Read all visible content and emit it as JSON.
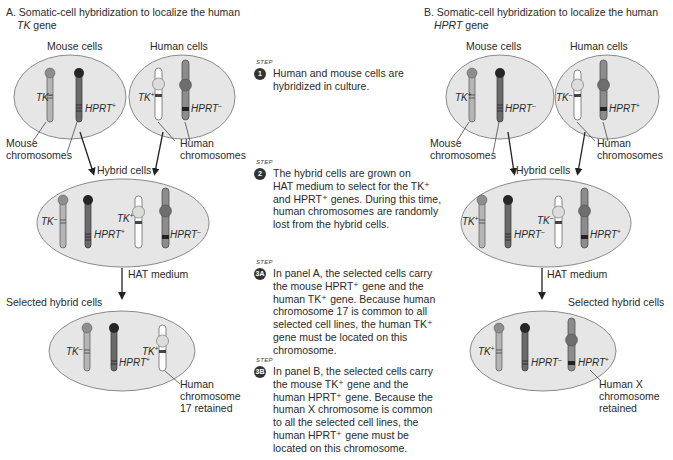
{
  "panelA": {
    "title_line1": "A. Somatic-cell hybridization to localize the human",
    "title_gene": "TK",
    "title_line2_suffix": " gene",
    "mouse_cells_label": "Mouse cells",
    "human_cells_label": "Human cells",
    "mouse_chromosomes_label_1": "Mouse",
    "mouse_chromosomes_label_2": "chromosomes",
    "human_chromosomes_label_1": "Human",
    "human_chromosomes_label_2": "chromosomes",
    "hybrid_cells_label": "Hybrid cells",
    "hat_medium_label": "HAT medium",
    "selected_label": "Selected hybrid cells",
    "retained_label_1": "Human",
    "retained_label_2": "chromosome",
    "retained_label_3": "17 retained",
    "mouse_cell": {
      "tk": "TK",
      "tk_sign": "–",
      "hprt": "HPRT",
      "hprt_sign": "+"
    },
    "human_cell": {
      "tk": "TK",
      "tk_sign": "+",
      "hprt": "HPRT",
      "hprt_sign": "–"
    },
    "hybrid_cell": {
      "mouse_tk": "TK",
      "mouse_tk_sign": "–",
      "mouse_hprt": "HPRT",
      "mouse_hprt_sign": "+",
      "human_tk": "TK",
      "human_tk_sign": "+",
      "human_hprt": "HPRT",
      "human_hprt_sign": "–"
    },
    "selected_cell": {
      "mouse_tk": "TK",
      "mouse_tk_sign": "–",
      "mouse_hprt": "HPRT",
      "mouse_hprt_sign": "+",
      "human_tk": "TK",
      "human_tk_sign": "+"
    }
  },
  "panelB": {
    "title_line1": "B. Somatic-cell hybridization to localize the human",
    "title_gene": "HPRT",
    "title_line2_suffix": " gene",
    "mouse_cells_label": "Mouse cells",
    "human_cells_label": "Human cells",
    "mouse_chromosomes_label_1": "Mouse",
    "mouse_chromosomes_label_2": "chromosomes",
    "human_chromosomes_label_1": "Human",
    "human_chromosomes_label_2": "chromosomes",
    "hybrid_cells_label": "Hybrid cells",
    "hat_medium_label": "HAT medium",
    "selected_label": "Selected hybrid cells",
    "retained_label_1": "Human X",
    "retained_label_2": "chromosome",
    "retained_label_3": "retained",
    "mouse_cell": {
      "tk": "TK",
      "tk_sign": "+",
      "hprt": "HPRT",
      "hprt_sign": "–"
    },
    "human_cell": {
      "tk": "TK",
      "tk_sign": "–",
      "hprt": "HPRT",
      "hprt_sign": "+"
    },
    "hybrid_cell": {
      "mouse_tk": "TK",
      "mouse_tk_sign": "+",
      "mouse_hprt": "HPRT",
      "mouse_hprt_sign": "–",
      "human_tk": "TK",
      "human_tk_sign": "–",
      "human_hprt": "HPRT",
      "human_hprt_sign": "+"
    },
    "selected_cell": {
      "mouse_tk": "TK",
      "mouse_tk_sign": "+",
      "mouse_hprt": "HPRT",
      "mouse_hprt_sign": "–",
      "human_hprt": "HPRT",
      "human_hprt_sign": "+"
    }
  },
  "steps": [
    {
      "tag": "STEP",
      "badge": "1",
      "lines": [
        "Human and mouse cells are",
        "hybridized in culture."
      ]
    },
    {
      "tag": "STEP",
      "badge": "2",
      "lines": [
        "The hybrid cells are grown on",
        "HAT medium to select for the TK⁺",
        "and HPRT⁺ genes. During this time,",
        "human chromosomes are randomly",
        "lost from the hybrid cells."
      ]
    },
    {
      "tag": "STEP",
      "badge": "3A",
      "lines": [
        "In panel A, the selected cells carry",
        "the mouse HPRT⁺ gene and the",
        "human TK⁺ gene. Because human",
        "chromosome 17 is common to all",
        "selected cell lines, the human TK⁺",
        "gene must be located on this",
        "chromosome."
      ]
    },
    {
      "tag": "STEP",
      "badge": "3B",
      "lines": [
        "In panel B, the selected cells carry",
        "the mouse TK⁺ gene and the",
        "human HPRT⁺ gene. Because the",
        "human X chromosome is common",
        "to all the selected cell lines, the",
        "human HPRT⁺ gene must be",
        "located on this chromosome."
      ]
    }
  ],
  "colors": {
    "cell_fill": "#e6e6e6",
    "cell_stroke": "#8a8a8a",
    "mouse_tk_chrom": "#b5b5b5",
    "mouse_tk_centromere": "#8e8e8e",
    "mouse_hprt_chrom": "#6a6a6a",
    "mouse_hprt_centromere": "#262626",
    "human_tk_chrom": "#ffffff",
    "human_tk_centromere": "#dcdcdc",
    "human_hprt_chrom": "#8c8c8c",
    "human_hprt_centromere": "#6e6e6e",
    "badge": "#333333",
    "text": "#2a2a2a"
  }
}
